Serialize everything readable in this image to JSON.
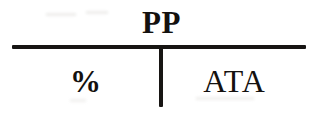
{
  "figure": {
    "kind": "scanned-table-header-fragment",
    "background_color": "#ffffff",
    "ink_color": "#14110f",
    "rule_color": "#171513"
  },
  "table": {
    "group_header": {
      "label": "PP"
    },
    "columns": [
      {
        "label": "%"
      },
      {
        "label": "ATA"
      }
    ]
  },
  "rules": {
    "spanner_rule_name": "horizontal-rule",
    "column_divider_name": "vertical-rule"
  }
}
